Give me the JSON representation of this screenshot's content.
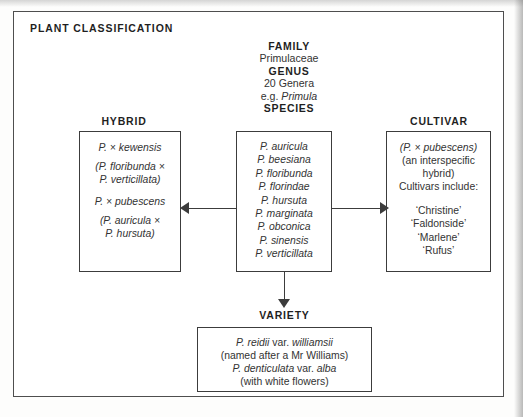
{
  "panel": {
    "title": "PLANT  CLASSIFICATION"
  },
  "rank_stack": {
    "family_label": "FAMILY",
    "family_value": "Primulaceae",
    "genus_label": "GENUS",
    "genus_count": "20 Genera",
    "genus_example_prefix": "e.g. ",
    "genus_example_name": "Primula",
    "species_label": "SPECIES"
  },
  "columns": {
    "hybrid_label": "HYBRID",
    "cultivar_label": "CULTIVAR",
    "variety_label": "VARIETY"
  },
  "hybrid_box": {
    "entries": [
      {
        "name": "P. × kewensis",
        "parents": "(P. floribunda ×\nP. verticillata)"
      },
      {
        "name": "P. × pubescens",
        "parents": "(P. auricula ×\nP. hursuta)"
      }
    ],
    "entry_1_name": "P. × kewensis",
    "entry_1_parent_a": "(P. floribunda ×",
    "entry_1_parent_b": "P. verticillata)",
    "entry_2_name": "P. × pubescens",
    "entry_2_parent_a": "(P. auricula ×",
    "entry_2_parent_b": "P. hursuta)"
  },
  "species_box": {
    "species": [
      "P. auricula",
      "P. beesiana",
      "P. floribunda",
      "P. florindae",
      "P. hursuta",
      "P. marginata",
      "P. obconica",
      "P. sinensis",
      "P. verticillata"
    ]
  },
  "cultivar_box": {
    "parent_hybrid": "(P. × pubescens)",
    "note_line_1": "(an interspecific",
    "note_line_2": "hybrid)",
    "includes_label": "Cultivars include:",
    "cultivars": [
      "‘Christine’",
      "‘Faldonside’",
      "‘Marlene’",
      "‘Rufus’"
    ]
  },
  "variety_box": {
    "line_1_a": "P. reidii",
    "line_1_b": " var. ",
    "line_1_c": "williamsii",
    "line_2": "(named after a Mr Williams)",
    "line_3_a": "P. denticulata",
    "line_3_b": " var. ",
    "line_3_c": "alba",
    "line_4": "(with white flowers)"
  },
  "connectors": {
    "species_to_hybrid": "arrow-left",
    "species_to_cultivar": "arrow-right",
    "species_to_variety": "arrow-down"
  },
  "colors": {
    "ink": "#3c3c3c",
    "text": "#333333",
    "heading": "#1f1f1f",
    "page": "#ffffff"
  }
}
